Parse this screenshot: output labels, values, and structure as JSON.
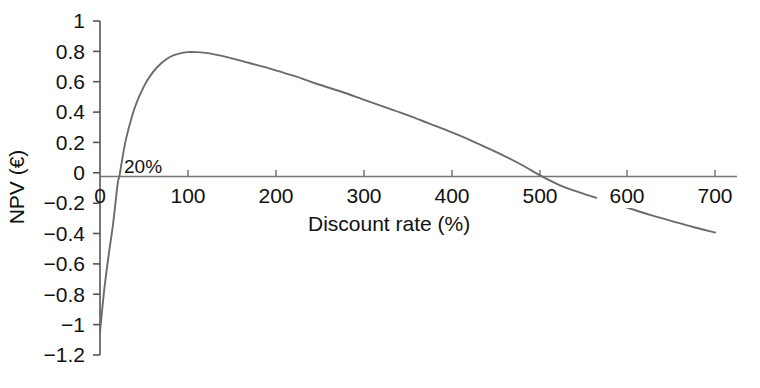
{
  "chart_data": {
    "type": "line",
    "title": "",
    "xlabel": "Discount rate (%)",
    "ylabel": "NPV (€)",
    "xlim": [
      0,
      700
    ],
    "ylim": [
      -1.2,
      1
    ],
    "grid": false,
    "legend": null,
    "line_color": "#6b6b6b",
    "axis_color": "#555555",
    "xticks": [
      0,
      100,
      200,
      300,
      400,
      500,
      600,
      700
    ],
    "xtick_labels": [
      "0",
      "100",
      "200",
      "300",
      "400",
      "500",
      "600",
      "700"
    ],
    "yticks": [
      -1.2,
      -1,
      -0.8,
      -0.6,
      -0.4,
      -0.2,
      0,
      0.2,
      0.4,
      0.6,
      0.8,
      1
    ],
    "ytick_labels": [
      "−1.2",
      "−1",
      "−0.8",
      "−0.6",
      "−0.4",
      "−0.2",
      "0",
      "0.2",
      "0.4",
      "0.6",
      "0.8",
      "1"
    ],
    "annotations": [
      {
        "text": "20%",
        "x": 22,
        "y": 0.12,
        "note": "internal rate of return crossing point"
      }
    ],
    "series": [
      {
        "name": "NPV",
        "x": [
          0,
          5,
          10,
          15,
          20,
          22,
          25,
          30,
          40,
          50,
          60,
          70,
          80,
          90,
          100,
          110,
          120,
          130,
          150,
          170,
          190,
          210,
          230,
          250,
          275,
          300,
          325,
          350,
          375,
          400,
          425,
          450,
          475,
          500,
          510,
          525,
          550,
          575,
          600,
          625,
          650,
          675,
          700
        ],
        "y": [
          -1.0,
          -0.72,
          -0.5,
          -0.3,
          -0.05,
          0.0,
          0.1,
          0.25,
          0.45,
          0.58,
          0.67,
          0.73,
          0.77,
          0.79,
          0.8,
          0.8,
          0.795,
          0.785,
          0.76,
          0.73,
          0.7,
          0.665,
          0.63,
          0.59,
          0.545,
          0.495,
          0.445,
          0.395,
          0.34,
          0.285,
          0.225,
          0.16,
          0.09,
          0.01,
          -0.02,
          -0.06,
          -0.11,
          -0.155,
          -0.2,
          -0.245,
          -0.285,
          -0.325,
          -0.36
        ]
      }
    ]
  },
  "axis": {
    "xlabel": "Discount rate (%)",
    "ylabel": "NPV (€)"
  },
  "annotation": {
    "irr_label": "20%"
  },
  "ytick_labels": {
    "t0": "1",
    "t1": "0.8",
    "t2": "0.6",
    "t3": "0.4",
    "t4": "0.2",
    "t5": "0",
    "t6": "−0.2",
    "t7": "−0.4",
    "t8": "−0.6",
    "t9": "−0.8",
    "t10": "−1",
    "t11": "−1.2"
  },
  "xtick_labels": {
    "t0": "0",
    "t1": "100",
    "t2": "200",
    "t3": "300",
    "t4": "400",
    "t5": "500",
    "t6": "600",
    "t7": "700"
  }
}
